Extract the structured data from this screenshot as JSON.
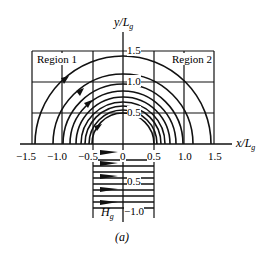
{
  "figure": {
    "caption": "(a)",
    "y_axis_label": "y/L",
    "y_axis_sub": "g",
    "x_axis_label": "x/L",
    "x_axis_sub": "g",
    "gap_label": "H",
    "gap_label_sub": "g",
    "regions": [
      "Region 1",
      "Region 2"
    ],
    "x_ticks": [
      "−1.5",
      "−1.0",
      "−0.5",
      "0",
      "0.5",
      "1.0",
      "1.5"
    ],
    "y_ticks_upper": [
      "1.5",
      "1.0",
      "0.5"
    ],
    "y_ticks_lower": [
      "0.5",
      "−1.0"
    ],
    "colors": {
      "line": "#111111",
      "background": "#ffffff"
    }
  }
}
